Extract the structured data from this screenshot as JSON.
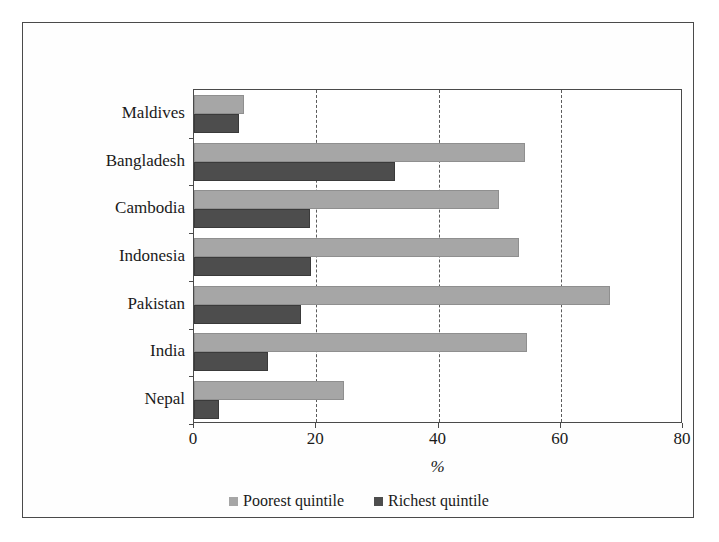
{
  "chart_data": {
    "type": "bar",
    "orientation": "horizontal",
    "title": "",
    "xlabel": "%",
    "ylabel": "",
    "xlim": [
      0,
      80
    ],
    "ylim": null,
    "grid": "vertical dashed at 20, 40, 60",
    "legend_position": "bottom-center",
    "xticks": [
      "0",
      "20",
      "40",
      "60",
      "80"
    ],
    "xtick_values": [
      0,
      20,
      40,
      60,
      80
    ],
    "gridline_values": [
      20,
      40,
      60
    ],
    "categories": [
      "Maldives",
      "Bangladesh",
      "Cambodia",
      "Indonesia",
      "Pakistan",
      "India",
      "Nepal"
    ],
    "series": [
      {
        "name": "Poorest quintile",
        "color": "#a6a6a6",
        "values": [
          8.2,
          54.2,
          49.9,
          53.2,
          68.1,
          54.5,
          24.6
        ]
      },
      {
        "name": "Richest quintile",
        "color": "#4d4d4d",
        "values": [
          7.4,
          32.9,
          19.0,
          19.1,
          17.5,
          12.1,
          4.1
        ]
      }
    ]
  },
  "colors": {
    "poorest": "#a6a6a6",
    "richest": "#4d4d4d",
    "axis": "#4a4a4a",
    "grid": "#5b5b5b",
    "frame": "#4a4a4a",
    "background": "#ffffff"
  }
}
